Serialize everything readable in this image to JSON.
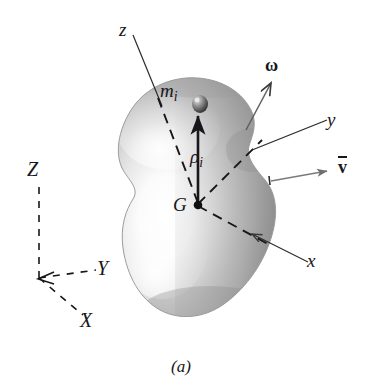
{
  "figure": {
    "caption": "(a)",
    "colors": {
      "ink": "#17161a",
      "body_light": "#ffffff",
      "body_mid": "#b9b9b9",
      "body_dark": "#8d8d8d",
      "leader_gray": "#6e6e6e",
      "background": "#ffffff"
    }
  },
  "labels": {
    "body_axis_z": "z",
    "body_axis_y": "y",
    "body_axis_x": "x",
    "mass_center": "G",
    "particle_mass": "m",
    "particle_mass_sub": "i",
    "position_vector": "ρ",
    "position_vector_sub": "i",
    "angular_velocity": "ω",
    "velocity_mass_center": "v",
    "fixed_axis_Z": "Z",
    "fixed_axis_Y": "Y",
    "fixed_axis_X": "X"
  }
}
